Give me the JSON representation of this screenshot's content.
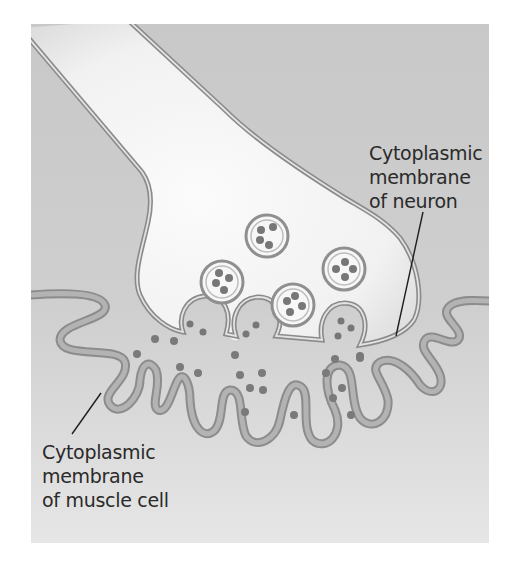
{
  "figure": {
    "colors": {
      "background_top": "#c9c9c9",
      "background_bottom": "#e6e6e6",
      "neuron_fill": "#f4f4f4",
      "membrane_stroke": "#8a8a8a",
      "muscle_membrane_band": "#a9a9a9",
      "vesicle_dot": "#7a7a7a",
      "label_text": "#2a2a2a"
    },
    "vesicle_count": 4,
    "synaptic_release_sites": 3
  },
  "labels": {
    "neuron": {
      "line1": "Cytoplasmic",
      "line2": "membrane",
      "line3": "of neuron"
    },
    "muscle": {
      "line1": "Cytoplasmic",
      "line2": "membrane",
      "line3": "of muscle cell"
    }
  }
}
